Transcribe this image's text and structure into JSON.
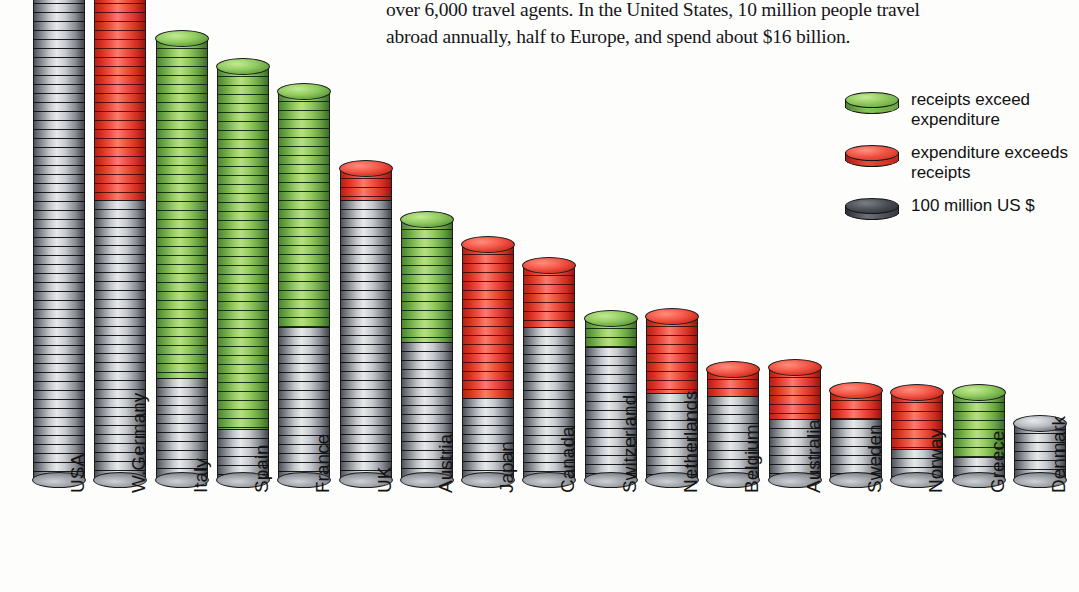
{
  "caption": {
    "text": "over 6,000 travel agents. In the United States, 10 million people travel\nabroad annually, half to Europe, and spend about $16 billion."
  },
  "legend": {
    "position": "top-right",
    "items": [
      {
        "label": "receipts exceed\nexpenditure",
        "color": "#8fc95e",
        "name": "legend-green"
      },
      {
        "label": "expenditure exceeds\nreceipts",
        "color": "#f0503f",
        "name": "legend-red"
      },
      {
        "label": "100 million  US $",
        "color": "#4c5057",
        "name": "legend-gray"
      }
    ]
  },
  "axis": {
    "y_ticks": [
      "0",
      "1",
      "2",
      "3",
      "4",
      "5",
      "6",
      "7",
      "8",
      "9"
    ]
  },
  "colors": {
    "green": "#8fc95e",
    "red": "#f0503f",
    "gray": "#b9bcc1",
    "outline": "#1c1c1c",
    "background": "#fdfdfb"
  },
  "chart_data": {
    "type": "bar",
    "title": "",
    "subtitle": "",
    "xlabel": "",
    "ylabel": "",
    "unit": "100 million US $",
    "ylim": [
      0,
      9.6
    ],
    "grid": false,
    "stacked": true,
    "note": "Each bar is a stack of coin-discs. Gray base = balanced amount; green top = receipts exceed expenditure; red top = expenditure exceeds receipts. Tallest two bars are clipped by the image edge.",
    "categories": [
      "USA",
      "W.Germany",
      "Italy",
      "Spain",
      "France",
      "UK",
      "Austria",
      "Japan",
      "Canada",
      "Switzerland",
      "Netherlands",
      "Belgium",
      "Australia",
      "Sweden",
      "Norway",
      "Greece",
      "Denmark"
    ],
    "series": [
      {
        "name": "100 million US $",
        "color": "#b9bcc1",
        "values": [
          9.7,
          5.5,
          2.0,
          1.0,
          3.0,
          5.5,
          2.7,
          1.6,
          3.0,
          2.6,
          1.7,
          1.65,
          1.2,
          1.2,
          0.6,
          0.45,
          1.1
        ]
      },
      {
        "name": "receipts exceed expenditure",
        "color": "#8fc95e",
        "values": [
          0,
          0,
          6.65,
          7.1,
          4.6,
          0,
          2.4,
          0,
          0,
          0.55,
          0,
          0,
          0,
          0,
          0,
          1.25,
          0
        ]
      },
      {
        "name": "expenditure exceeds receipts",
        "color": "#f0503f",
        "values": [
          0,
          4.2,
          0,
          0,
          0,
          0.6,
          0,
          3.0,
          1.2,
          0,
          1.5,
          0.5,
          1.0,
          0.55,
          1.1,
          0,
          0
        ]
      }
    ],
    "totals": [
      9.7,
      9.7,
      8.65,
      8.1,
      7.6,
      6.1,
      5.1,
      4.6,
      4.2,
      3.15,
      3.2,
      2.15,
      2.2,
      1.75,
      1.7,
      1.7,
      1.1
    ],
    "clipped_at_top": [
      "USA",
      "W.Germany"
    ]
  }
}
